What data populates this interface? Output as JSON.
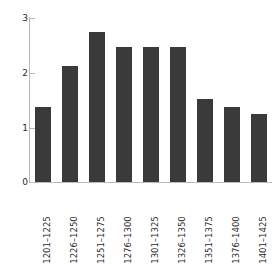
{
  "chart_data": {
    "type": "bar",
    "title": "",
    "subtitle": "",
    "xlabel": "",
    "ylabel": "",
    "categories": [
      "1201–1225",
      "1226–1250",
      "1251–1275",
      "1276–1300",
      "1301–1325",
      "1326–1350",
      "1351–1375",
      "1376–1400",
      "1401–1425"
    ],
    "values": [
      1.36,
      2.11,
      2.73,
      2.46,
      2.46,
      2.46,
      1.51,
      1.36,
      1.24
    ],
    "ylim": [
      0,
      3
    ],
    "yticks": [
      0,
      1,
      2,
      3
    ],
    "ytick_labels": [
      "0",
      "1",
      "2",
      "3"
    ],
    "grid": false,
    "legend": null,
    "legend_position": "none",
    "bar_color": "#3a3a3a",
    "axis_color": "#b9b9b9",
    "background_color": "#ffffff",
    "xtick_rotation": 90,
    "annotations": []
  }
}
